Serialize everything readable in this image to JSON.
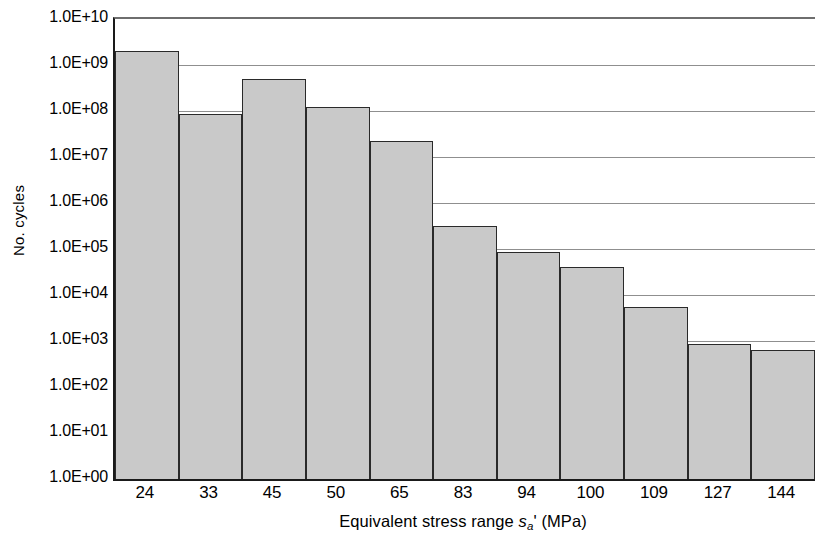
{
  "chart_data": {
    "type": "bar",
    "title": "",
    "xlabel_parts": {
      "prefix": "Equivalent stress range ",
      "symbol": "s",
      "subscript": "a",
      "suffix": "' (MPa)"
    },
    "xlabel": "Equivalent stress range s_a' (MPa)",
    "ylabel": "No. cycles",
    "yscale": "log",
    "ylim": [
      1,
      10000000000
    ],
    "ytick_labels": [
      "1.0E+10",
      "1.0E+09",
      "1.0E+08",
      "1.0E+07",
      "1.0E+06",
      "1.0E+05",
      "1.0E+04",
      "1.0E+03",
      "1.0E+02",
      "1.0E+01",
      "1.0E+00"
    ],
    "ytick_values": [
      10000000000,
      1000000000,
      100000000,
      10000000,
      1000000,
      100000,
      10000,
      1000,
      100,
      10,
      1
    ],
    "grid": true,
    "grid_axis": "y",
    "legend": null,
    "categories": [
      "24",
      "33",
      "45",
      "50",
      "65",
      "83",
      "94",
      "100",
      "109",
      "127",
      "144"
    ],
    "values": [
      2000000000.0,
      85000000.0,
      500000000.0,
      120000000.0,
      22000000.0,
      320000.0,
      85000.0,
      40000.0,
      5500.0,
      850.0,
      650.0
    ],
    "series": [
      {
        "name": "No. cycles",
        "values": [
          2000000000.0,
          85000000.0,
          500000000.0,
          120000000.0,
          22000000.0,
          320000.0,
          85000.0,
          40000.0,
          5500.0,
          850.0,
          650.0
        ]
      }
    ],
    "bar_fill_color": "#c9c9c9",
    "bar_border_color": "#2a2a2a",
    "gridline_color": "#8f8f8f",
    "axis_color": "#1a1a1a"
  }
}
